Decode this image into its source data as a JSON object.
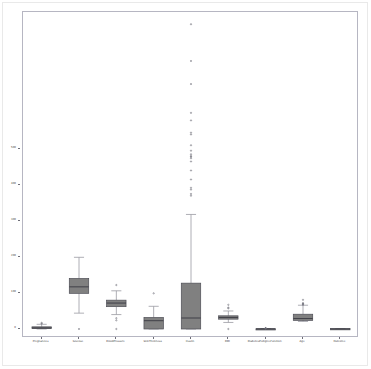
{
  "figure": {
    "background_color": "#ffffff",
    "axes_border_color": "#b6b6c2",
    "box_fill_color": "#808080",
    "box_edge_color": "#4d4d55",
    "median_color": "#3f3f47",
    "whisker_color": "#9a9aa2",
    "cap_color": "#9a9aa2",
    "flier_color": "#6e6e78"
  },
  "chart_data": {
    "type": "box",
    "title": "",
    "xlabel": "",
    "ylabel": "",
    "grid": false,
    "legend": null,
    "ylim": [
      -25,
      880
    ],
    "yticks": [
      0,
      100,
      200,
      300,
      400,
      500
    ],
    "ytick_labels": [
      "0",
      "100",
      "200",
      "300",
      "400",
      "500"
    ],
    "categories": [
      "Pregnancies",
      "Glucose",
      "BloodPressure",
      "SkinThickness",
      "Insulin",
      "BMI",
      "DiabetesPedigreeFunction",
      "Age",
      "Outcome"
    ],
    "boxes": [
      {
        "name": "Pregnancies",
        "whisker_low": 0,
        "q1": 1,
        "median": 3,
        "q3": 6,
        "whisker_high": 13,
        "fliers": [
          15,
          17
        ]
      },
      {
        "name": "Glucose",
        "whisker_low": 44,
        "q1": 99,
        "median": 117,
        "q3": 140.25,
        "whisker_high": 199,
        "fliers": [
          0
        ]
      },
      {
        "name": "BloodPressure",
        "whisker_low": 40,
        "q1": 62,
        "median": 72,
        "q3": 80,
        "whisker_high": 106,
        "fliers": [
          0,
          24,
          30,
          122
        ]
      },
      {
        "name": "SkinThickness",
        "whisker_low": 0,
        "q1": 0,
        "median": 23,
        "q3": 32,
        "whisker_high": 63,
        "fliers": [
          99
        ]
      },
      {
        "name": "Insulin",
        "whisker_low": 0,
        "q1": 0,
        "median": 30.5,
        "q3": 127.25,
        "whisker_high": 318,
        "fliers": [
          370,
          375,
          387,
          392,
          415,
          440,
          465,
          474,
          478,
          480,
          485,
          495,
          510,
          540,
          545,
          579,
          600,
          680,
          744,
          846
        ]
      },
      {
        "name": "BMI",
        "whisker_low": 18.2,
        "q1": 27.3,
        "median": 32.0,
        "q3": 36.6,
        "whisker_high": 50.0,
        "fliers": [
          0,
          57.3,
          59.4,
          67.1
        ]
      },
      {
        "name": "DiabetesPedigreeFunction",
        "whisker_low": 0.078,
        "q1": 0.2437,
        "median": 0.3725,
        "q3": 0.62625,
        "whisker_high": 1.19,
        "fliers": [
          1.4,
          1.6,
          2.0,
          2.42
        ]
      },
      {
        "name": "Age",
        "whisker_low": 21,
        "q1": 24,
        "median": 29,
        "q3": 41,
        "whisker_high": 66,
        "fliers": [
          67,
          69,
          70,
          72,
          81
        ]
      },
      {
        "name": "Outcome",
        "whisker_low": 0,
        "q1": 0,
        "median": 0,
        "q3": 1,
        "whisker_high": 1,
        "fliers": []
      }
    ]
  }
}
